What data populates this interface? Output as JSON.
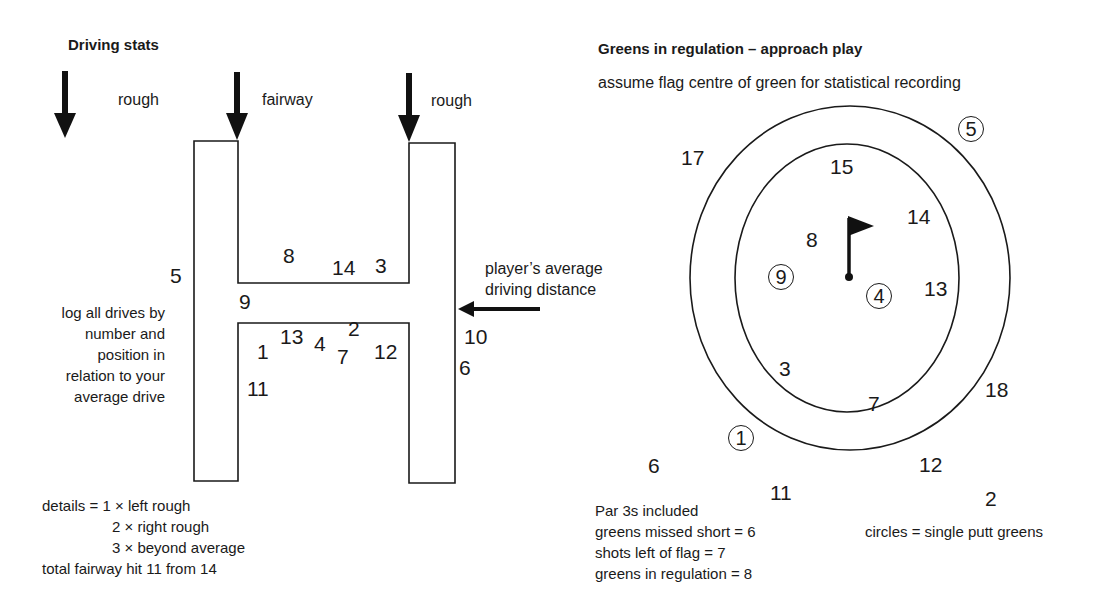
{
  "driving": {
    "title": "Driving stats",
    "labels": {
      "left_rough": "rough",
      "fairway": "fairway",
      "right_rough": "rough"
    },
    "arrow_label": "player’s average\ndriving distance",
    "arrow_label_line1": "player’s average",
    "arrow_label_line2": "driving distance",
    "instruction_lines": [
      "log all drives by",
      "number and",
      "position in",
      "relation to your",
      "average drive"
    ],
    "drives": [
      {
        "n": "5",
        "zone": "left rough"
      },
      {
        "n": "8",
        "zone": "beyond average"
      },
      {
        "n": "14",
        "zone": "beyond average"
      },
      {
        "n": "3",
        "zone": "beyond average"
      },
      {
        "n": "9",
        "zone": "fairway"
      },
      {
        "n": "1",
        "zone": "fairway"
      },
      {
        "n": "13",
        "zone": "fairway"
      },
      {
        "n": "4",
        "zone": "fairway"
      },
      {
        "n": "2",
        "zone": "fairway"
      },
      {
        "n": "7",
        "zone": "fairway"
      },
      {
        "n": "12",
        "zone": "fairway"
      },
      {
        "n": "11",
        "zone": "fairway"
      },
      {
        "n": "10",
        "zone": "right rough"
      },
      {
        "n": "6",
        "zone": "right rough"
      }
    ],
    "details": {
      "line1": "details = 1 × left rough",
      "line2": "2 × right rough",
      "line3": "3 × beyond average",
      "total": "total fairway hit  11 from 14"
    }
  },
  "greens": {
    "title": "Greens in regulation – approach play",
    "subtitle": "assume flag centre of green for statistical recording",
    "shots": [
      {
        "n": "17",
        "circled": false
      },
      {
        "n": "5",
        "circled": true
      },
      {
        "n": "15",
        "circled": false
      },
      {
        "n": "14",
        "circled": false
      },
      {
        "n": "8",
        "circled": false
      },
      {
        "n": "9",
        "circled": true
      },
      {
        "n": "4",
        "circled": true
      },
      {
        "n": "13",
        "circled": false
      },
      {
        "n": "3",
        "circled": false
      },
      {
        "n": "18",
        "circled": false
      },
      {
        "n": "7",
        "circled": false
      },
      {
        "n": "1",
        "circled": true
      },
      {
        "n": "6",
        "circled": false
      },
      {
        "n": "12",
        "circled": false
      },
      {
        "n": "11",
        "circled": false
      },
      {
        "n": "2",
        "circled": false
      }
    ],
    "notes": {
      "line1": "Par 3s included",
      "line2": "greens missed short = 6",
      "line3": "shots left of flag = 7",
      "line4": "greens in regulation = 8"
    },
    "legend": "circles = single putt greens"
  }
}
